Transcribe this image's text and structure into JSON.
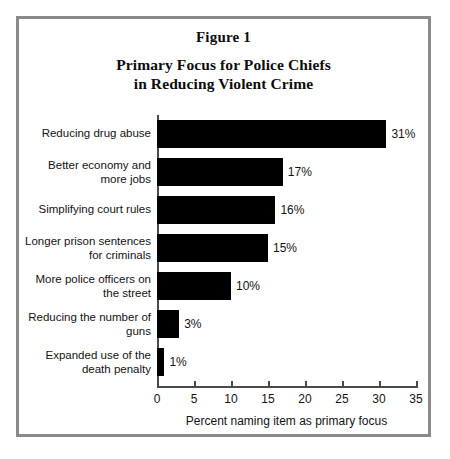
{
  "figure": {
    "number_label": "Figure 1",
    "title_line1": "Primary Focus for Police Chiefs",
    "title_line2": "in Reducing Violent Crime"
  },
  "chart_data": {
    "type": "bar",
    "orientation": "horizontal",
    "title": "Primary Focus for Police Chiefs in Reducing Violent Crime",
    "subtitle": "Figure 1",
    "xlabel": "Percent naming item as primary focus",
    "ylabel": "",
    "xlim": [
      0,
      35
    ],
    "xticks": [
      0,
      5,
      10,
      15,
      20,
      25,
      30,
      35
    ],
    "xtick_labels": [
      "0",
      "5",
      "10",
      "15",
      "20",
      "25",
      "30",
      "35"
    ],
    "grid": false,
    "legend": null,
    "bar_color": "#000000",
    "categories": [
      "Reducing drug abuse",
      "Better economy and\nmore jobs",
      "Simplifying court rules",
      "Longer prison sentences\nfor criminals",
      "More police officers on\nthe street",
      "Reducing the number of\nguns",
      "Expanded use of the\ndeath penalty"
    ],
    "values": [
      31,
      17,
      16,
      15,
      10,
      3,
      1
    ],
    "data_labels": [
      "31%",
      "17%",
      "16%",
      "15%",
      "10%",
      "3%",
      "1%"
    ]
  }
}
